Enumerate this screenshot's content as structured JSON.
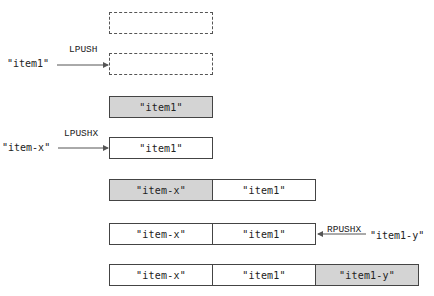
{
  "steps": [
    {
      "cells": [
        {
          "text": "",
          "style": "empty"
        }
      ]
    },
    {
      "input": "\"item1\"",
      "command": "LPUSH",
      "cells": [
        {
          "text": "",
          "style": "empty"
        }
      ]
    },
    {
      "cells": [
        {
          "text": "\"item1\"",
          "style": "shaded"
        }
      ]
    },
    {
      "input": "\"item-x\"",
      "command": "LPUSHX",
      "cells": [
        {
          "text": "\"item1\"",
          "style": "plain"
        }
      ]
    },
    {
      "cells": [
        {
          "text": "\"item-x\"",
          "style": "shaded"
        },
        {
          "text": "\"item1\"",
          "style": "plain"
        }
      ]
    },
    {
      "input": "\"item1-y\"",
      "command": "RPUSHX",
      "cells": [
        {
          "text": "\"item-x\"",
          "style": "plain"
        },
        {
          "text": "\"item1\"",
          "style": "plain"
        }
      ]
    },
    {
      "cells": [
        {
          "text": "\"item-x\"",
          "style": "plain"
        },
        {
          "text": "\"item1\"",
          "style": "plain"
        },
        {
          "text": "\"item1-y\"",
          "style": "shaded"
        }
      ]
    }
  ],
  "colors": {
    "shaded": "#d4d4d4",
    "border": "#444444",
    "arrow": "#555555"
  }
}
